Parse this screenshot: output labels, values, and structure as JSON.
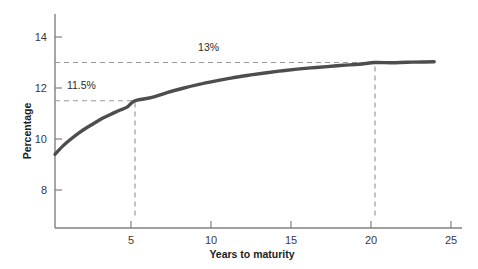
{
  "chart_data": {
    "type": "line",
    "title": "",
    "xlabel": "Years to maturity",
    "ylabel": "Percentage",
    "xlim": [
      0,
      25
    ],
    "ylim": [
      7.0,
      14.8
    ],
    "grid": false,
    "legend": "none",
    "x_ticks": [
      "5",
      "10",
      "15",
      "20",
      "25"
    ],
    "x_tick_values": [
      5,
      10,
      15,
      20,
      25
    ],
    "y_ticks": [
      "8",
      "10",
      "12",
      "14"
    ],
    "y_tick_values": [
      8,
      10,
      12,
      14
    ],
    "series": [
      {
        "name": "Yield curve",
        "color": "#4d4d4d",
        "x": [
          0.0,
          0.5,
          1.0,
          1.5,
          2.0,
          2.5,
          3.0,
          3.5,
          4.0,
          4.5,
          5.0,
          6.0,
          7.0,
          8.0,
          9.0,
          10.0,
          11.0,
          12.0,
          13.0,
          14.0,
          15.0,
          16.0,
          17.0,
          18.0,
          19.0,
          20.0,
          21.0,
          22.0,
          23.0,
          23.7
        ],
        "y": [
          9.4,
          9.73,
          10.0,
          10.24,
          10.45,
          10.64,
          10.82,
          10.97,
          11.12,
          11.25,
          11.5,
          11.62,
          11.82,
          11.99,
          12.14,
          12.27,
          12.39,
          12.49,
          12.58,
          12.66,
          12.73,
          12.79,
          12.84,
          12.89,
          12.93,
          13.0,
          12.99,
          13.01,
          13.02,
          13.03
        ]
      }
    ],
    "annotations": [
      {
        "name": "upper-asymptote",
        "label": "13%",
        "type": "horizontal-dashed",
        "y_value": 13.0,
        "x_from": 0,
        "x_to": 20,
        "label_x": 9.6,
        "label_y": 13.45
      },
      {
        "name": "five-year-yield",
        "label": "11.5%",
        "type": "horizontal-dashed",
        "y_value": 11.5,
        "x_from": 0,
        "x_to": 5,
        "label_x": 1.65,
        "label_y": 11.95
      },
      {
        "name": "five-year-marker",
        "label": "",
        "type": "vertical-dashed",
        "x_value": 5,
        "y_from": 7.0,
        "y_to": 11.5
      },
      {
        "name": "twenty-year-marker",
        "label": "",
        "type": "vertical-dashed",
        "x_value": 20,
        "y_from": 7.0,
        "y_to": 13.0
      }
    ],
    "colors": {
      "curve": "#4d4d4d",
      "axis": "#808080",
      "dashed": "#9a9a9a",
      "text": "#2b2b2b"
    }
  }
}
